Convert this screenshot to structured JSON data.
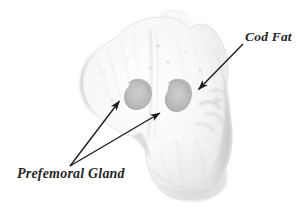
{
  "figure": {
    "background_color": "#ffffff",
    "width": 304,
    "height": 211,
    "specimen_colors": {
      "tissue_light": "#fbfbfb",
      "tissue_mid": "#ededed",
      "tissue_shadow": "#d8d8d8",
      "tissue_edge": "#c4c4c4",
      "gland_opening": "#b9b9b9",
      "gland_opening_dark": "#a3a3a3"
    }
  },
  "annotations": {
    "cod_fat": {
      "label": "Cod Fat",
      "icon": "leader-arrow-icon",
      "text_color": "#262626",
      "arrow_color": "#1a1a1a",
      "arrow_tail": {
        "x": 243,
        "y": 44
      },
      "arrow_tip": {
        "x": 196,
        "y": 92
      }
    },
    "prefemoral_gland": {
      "label": "Prefemoral Gland",
      "icon": "leader-arrow-icon",
      "text_color": "#262626",
      "arrow_color": "#1a1a1a",
      "arrow_origin": {
        "x": 70,
        "y": 166
      },
      "arrow_tips": [
        {
          "x": 122,
          "y": 98
        },
        {
          "x": 163,
          "y": 110
        }
      ]
    }
  }
}
